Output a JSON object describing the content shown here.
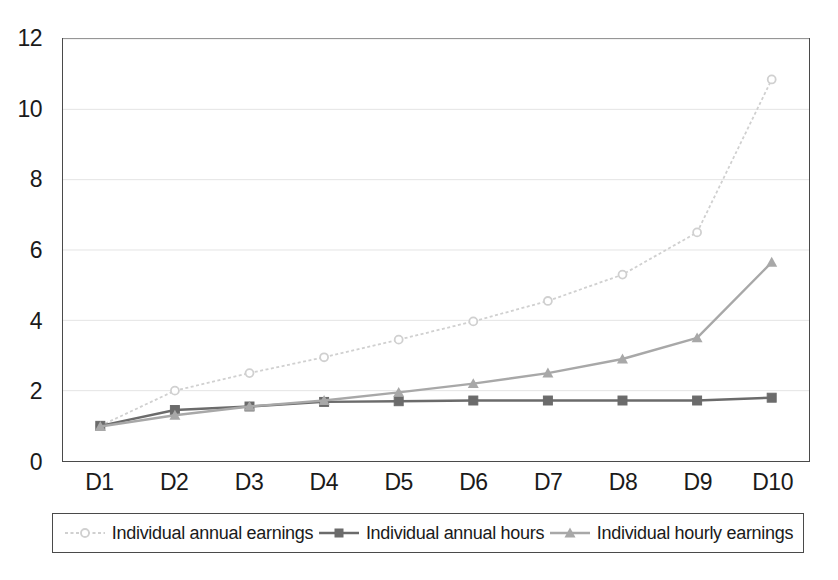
{
  "chart_data": {
    "type": "line",
    "title": "",
    "subtitle": "",
    "xlabel": "",
    "ylabel": "",
    "categories": [
      "D1",
      "D2",
      "D3",
      "D4",
      "D5",
      "D6",
      "D7",
      "D8",
      "D9",
      "D10"
    ],
    "ylim": [
      0,
      12
    ],
    "y_ticks": [
      0,
      2,
      4,
      6,
      8,
      10,
      12
    ],
    "y_tick_labels": [
      "0",
      "2",
      "4",
      "6",
      "8",
      "10",
      "12"
    ],
    "grid": "horizontal",
    "legend_position": "bottom",
    "series": [
      {
        "name": "Individual annual earnings",
        "color": "#d0d0d0",
        "marker": "circle",
        "line_style": "dotted",
        "values": [
          1.0,
          2.0,
          2.5,
          2.95,
          3.45,
          3.97,
          4.55,
          5.3,
          6.5,
          10.85
        ]
      },
      {
        "name": "Individual annual hours",
        "color": "#6b6b6b",
        "marker": "square",
        "line_style": "solid",
        "values": [
          1.0,
          1.45,
          1.55,
          1.68,
          1.7,
          1.72,
          1.72,
          1.72,
          1.72,
          1.8
        ]
      },
      {
        "name": "Individual hourly earnings",
        "color": "#a8a8a8",
        "marker": "triangle",
        "line_style": "solid",
        "values": [
          0.98,
          1.3,
          1.55,
          1.72,
          1.95,
          2.2,
          2.5,
          2.9,
          3.5,
          5.65
        ]
      }
    ]
  },
  "axes": {
    "frame_color": "#4a4a4a",
    "gridline_color": "#e4e4e4"
  },
  "legend": {
    "entries": [
      {
        "label": "Individual annual earnings"
      },
      {
        "label": "Individual annual hours"
      },
      {
        "label": "Individual hourly earnings"
      }
    ]
  }
}
